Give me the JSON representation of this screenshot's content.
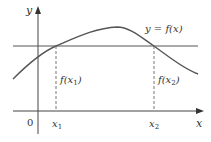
{
  "diagram": {
    "axis_x_label": "x",
    "axis_y_label": "y",
    "origin_label": "0",
    "curve_label": "y = f(x)",
    "x1_label": "x",
    "x1_sub": "1",
    "x2_label": "x",
    "x2_sub": "2",
    "fx1_label_pre": "f(x",
    "fx1_sub": "1",
    "fx1_label_post": ")",
    "fx2_label_pre": "f(x",
    "fx2_sub": "2",
    "fx2_label_post": ")",
    "colors": {
      "curve": "#555555",
      "axes": "#444444",
      "horizontal_line": "#555555",
      "dashed": "#666666"
    }
  }
}
